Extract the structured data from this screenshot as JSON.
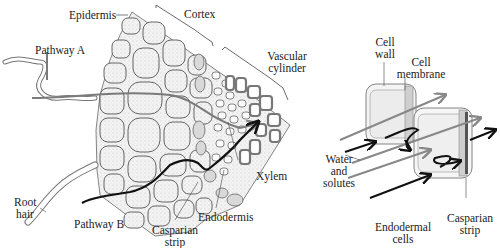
{
  "figure": {
    "left_panel": {
      "title": "Root cross section",
      "labels": {
        "epidermis": "Epidermis",
        "cortex": "Cortex",
        "vascular_cylinder_line1": "Vascular",
        "vascular_cylinder_line2": "cylinder",
        "pathway_a": "Pathway A",
        "pathway_b": "Pathway B",
        "root_hair_line1": "Root",
        "root_hair_line2": "hair",
        "xylem": "Xylem",
        "endodermis": "Endodermis",
        "casparian_line1": "Casparian",
        "casparian_line2": "strip"
      },
      "colors": {
        "pathway_a": "#7a7a7a",
        "pathway_b": "#111111",
        "cell_fill": "#ececec",
        "cell_outline": "#555555"
      }
    },
    "right_panel": {
      "title": "Endodermal cells detail",
      "labels": {
        "cell_wall_line1": "Cell",
        "cell_wall_line2": "wall",
        "cell_membrane_line1": "Cell",
        "cell_membrane_line2": "membrane",
        "water_line1": "Water",
        "water_line2": "and",
        "water_line3": "solutes",
        "endodermal_line1": "Endodermal",
        "endodermal_line2": "cells",
        "casparian_line1": "Casparian",
        "casparian_line2": "strip"
      },
      "colors": {
        "arrow_gray": "#888888",
        "arrow_black": "#111111",
        "cell_fill": "#f0f0f0"
      }
    }
  }
}
